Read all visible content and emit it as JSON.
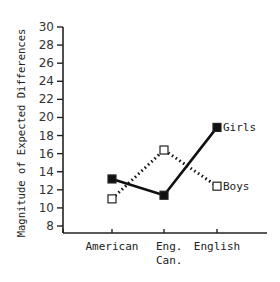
{
  "chart_data": {
    "type": "line",
    "title": "",
    "xlabel": "",
    "ylabel": "Magnitude of Expected Differences",
    "categories": [
      "American",
      "Eng. Can.",
      "English"
    ],
    "category_lines": [
      [
        "American"
      ],
      [
        "Eng.",
        "Can."
      ],
      [
        "English"
      ]
    ],
    "yticks": [
      8,
      10,
      12,
      14,
      16,
      18,
      20,
      22,
      24,
      26,
      28,
      30
    ],
    "ylim": [
      7,
      30
    ],
    "grid": false,
    "legend": "inline labels at line ends",
    "series": [
      {
        "name": "Girls",
        "style": "solid",
        "marker": "filled-square",
        "values": [
          13.2,
          11.4,
          18.9
        ],
        "color": "#111111"
      },
      {
        "name": "Boys",
        "style": "dotted",
        "marker": "open-square",
        "values": [
          11.0,
          16.4,
          12.4
        ],
        "color": "#111111"
      }
    ]
  }
}
